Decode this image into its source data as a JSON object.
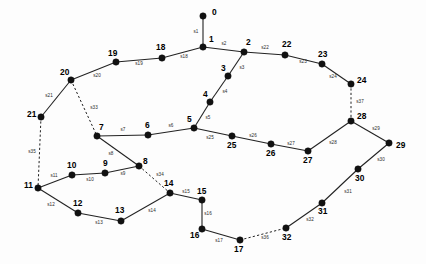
{
  "diagram": {
    "type": "node-link-graph",
    "background_color": "#fdfdfd",
    "node_color": "#111111",
    "edge_color": "#222222",
    "label_color": "#000000",
    "canvas": {
      "width": 426,
      "height": 264
    },
    "node_count": 33,
    "edge_count": 37
  },
  "nodes": [
    {
      "id": "0",
      "label": "0",
      "x": 203,
      "y": 16,
      "lx": 212,
      "ly": 13,
      "anchor": "start"
    },
    {
      "id": "1",
      "label": "1",
      "x": 203,
      "y": 47,
      "lx": 209,
      "ly": 40,
      "anchor": "start"
    },
    {
      "id": "2",
      "label": "2",
      "x": 244,
      "y": 52,
      "lx": 246,
      "ly": 43,
      "anchor": "start"
    },
    {
      "id": "3",
      "label": "3",
      "x": 228,
      "y": 76,
      "lx": 221,
      "ly": 69,
      "anchor": "start"
    },
    {
      "id": "4",
      "label": "4",
      "x": 210,
      "y": 102,
      "lx": 203,
      "ly": 95,
      "anchor": "start"
    },
    {
      "id": "5",
      "label": "5",
      "x": 194,
      "y": 128,
      "lx": 187,
      "ly": 120,
      "anchor": "start"
    },
    {
      "id": "6",
      "label": "6",
      "x": 148,
      "y": 135,
      "lx": 145,
      "ly": 126,
      "anchor": "start"
    },
    {
      "id": "7",
      "label": "7",
      "x": 97,
      "y": 136,
      "lx": 99,
      "ly": 128,
      "anchor": "start"
    },
    {
      "id": "8",
      "label": "8",
      "x": 139,
      "y": 166,
      "lx": 143,
      "ly": 162,
      "anchor": "start"
    },
    {
      "id": "9",
      "label": "9",
      "x": 105,
      "y": 173,
      "lx": 103,
      "ly": 164,
      "anchor": "start"
    },
    {
      "id": "10",
      "label": "10",
      "x": 72,
      "y": 175,
      "lx": 67,
      "ly": 166,
      "anchor": "start"
    },
    {
      "id": "11",
      "label": "11",
      "x": 38,
      "y": 188,
      "lx": 24,
      "ly": 186,
      "anchor": "start"
    },
    {
      "id": "12",
      "label": "12",
      "x": 78,
      "y": 213,
      "lx": 73,
      "ly": 204,
      "anchor": "start"
    },
    {
      "id": "13",
      "label": "13",
      "x": 121,
      "y": 221,
      "lx": 115,
      "ly": 211,
      "anchor": "start"
    },
    {
      "id": "14",
      "label": "14",
      "x": 170,
      "y": 193,
      "lx": 164,
      "ly": 184,
      "anchor": "start"
    },
    {
      "id": "15",
      "label": "15",
      "x": 202,
      "y": 200,
      "lx": 197,
      "ly": 192,
      "anchor": "start"
    },
    {
      "id": "16",
      "label": "16",
      "x": 202,
      "y": 229,
      "lx": 190,
      "ly": 236,
      "anchor": "start"
    },
    {
      "id": "17",
      "label": "17",
      "x": 240,
      "y": 240,
      "lx": 234,
      "ly": 250,
      "anchor": "start"
    },
    {
      "id": "18",
      "label": "18",
      "x": 162,
      "y": 58,
      "lx": 156,
      "ly": 48,
      "anchor": "start"
    },
    {
      "id": "19",
      "label": "19",
      "x": 116,
      "y": 62,
      "lx": 108,
      "ly": 54,
      "anchor": "start"
    },
    {
      "id": "20",
      "label": "20",
      "x": 71,
      "y": 80,
      "lx": 60,
      "ly": 73,
      "anchor": "start"
    },
    {
      "id": "21",
      "label": "21",
      "x": 41,
      "y": 117,
      "lx": 27,
      "ly": 115,
      "anchor": "start"
    },
    {
      "id": "22",
      "label": "22",
      "x": 285,
      "y": 55,
      "lx": 282,
      "ly": 45,
      "anchor": "start"
    },
    {
      "id": "23",
      "label": "23",
      "x": 322,
      "y": 64,
      "lx": 318,
      "ly": 55,
      "anchor": "start"
    },
    {
      "id": "24",
      "label": "24",
      "x": 351,
      "y": 84,
      "lx": 357,
      "ly": 81,
      "anchor": "start"
    },
    {
      "id": "25",
      "label": "25",
      "x": 232,
      "y": 136,
      "lx": 227,
      "ly": 146,
      "anchor": "start"
    },
    {
      "id": "26",
      "label": "26",
      "x": 271,
      "y": 144,
      "lx": 266,
      "ly": 154,
      "anchor": "start"
    },
    {
      "id": "27",
      "label": "27",
      "x": 308,
      "y": 151,
      "lx": 303,
      "ly": 161,
      "anchor": "start"
    },
    {
      "id": "28",
      "label": "28",
      "x": 351,
      "y": 121,
      "lx": 357,
      "ly": 117,
      "anchor": "start"
    },
    {
      "id": "29",
      "label": "29",
      "x": 389,
      "y": 143,
      "lx": 396,
      "ly": 146,
      "anchor": "start"
    },
    {
      "id": "30",
      "label": "30",
      "x": 358,
      "y": 169,
      "lx": 355,
      "ly": 179,
      "anchor": "start"
    },
    {
      "id": "31",
      "label": "31",
      "x": 322,
      "y": 203,
      "lx": 318,
      "ly": 212,
      "anchor": "start"
    },
    {
      "id": "32",
      "label": "32",
      "x": 286,
      "y": 228,
      "lx": 282,
      "ly": 238,
      "anchor": "start"
    }
  ],
  "edges": [
    {
      "id": "s1",
      "label": "s1",
      "from": "0",
      "to": "1",
      "style": "solid",
      "lx": 196,
      "ly": 32
    },
    {
      "id": "s2",
      "label": "s2",
      "from": "1",
      "to": "2",
      "style": "solid",
      "lx": 224,
      "ly": 44
    },
    {
      "id": "s3",
      "label": "s3",
      "from": "2",
      "to": "3",
      "style": "solid",
      "lx": 242,
      "ly": 68
    },
    {
      "id": "s4",
      "label": "s4",
      "from": "3",
      "to": "4",
      "style": "solid",
      "lx": 225,
      "ly": 92
    },
    {
      "id": "s5",
      "label": "s5",
      "from": "4",
      "to": "5",
      "style": "solid",
      "lx": 208,
      "ly": 118
    },
    {
      "id": "s6",
      "label": "s6",
      "from": "5",
      "to": "6",
      "style": "solid",
      "lx": 171,
      "ly": 126
    },
    {
      "id": "s7",
      "label": "s7",
      "from": "6",
      "to": "7",
      "style": "solid",
      "lx": 123,
      "ly": 130
    },
    {
      "id": "s8",
      "label": "s8",
      "from": "7",
      "to": "8",
      "style": "solid",
      "lx": 111,
      "ly": 154
    },
    {
      "id": "s9",
      "label": "s9",
      "from": "9",
      "to": "8",
      "style": "solid",
      "lx": 123,
      "ly": 174
    },
    {
      "id": "s10",
      "label": "s10",
      "from": "10",
      "to": "9",
      "style": "solid",
      "lx": 90,
      "ly": 180
    },
    {
      "id": "s11",
      "label": "s11",
      "from": "11",
      "to": "10",
      "style": "solid",
      "lx": 54,
      "ly": 176
    },
    {
      "id": "s12",
      "label": "s12",
      "from": "11",
      "to": "12",
      "style": "solid",
      "lx": 51,
      "ly": 205
    },
    {
      "id": "s13",
      "label": "s13",
      "from": "12",
      "to": "13",
      "style": "solid",
      "lx": 99,
      "ly": 223
    },
    {
      "id": "s14",
      "label": "s14",
      "from": "13",
      "to": "14",
      "style": "solid",
      "lx": 152,
      "ly": 211
    },
    {
      "id": "s15",
      "label": "s15",
      "from": "14",
      "to": "15",
      "style": "solid",
      "lx": 186,
      "ly": 192
    },
    {
      "id": "s16",
      "label": "s16",
      "from": "15",
      "to": "16",
      "style": "solid",
      "lx": 208,
      "ly": 214
    },
    {
      "id": "s17",
      "label": "s17",
      "from": "16",
      "to": "17",
      "style": "solid",
      "lx": 219,
      "ly": 241
    },
    {
      "id": "s18",
      "label": "s18",
      "from": "1",
      "to": "18",
      "style": "solid",
      "lx": 184,
      "ly": 57
    },
    {
      "id": "s19",
      "label": "s19",
      "from": "18",
      "to": "19",
      "style": "solid",
      "lx": 139,
      "ly": 64
    },
    {
      "id": "s20",
      "label": "s20",
      "from": "19",
      "to": "20",
      "style": "solid",
      "lx": 97,
      "ly": 76
    },
    {
      "id": "s21",
      "label": "s21",
      "from": "20",
      "to": "21",
      "style": "solid",
      "lx": 49,
      "ly": 96
    },
    {
      "id": "s22",
      "label": "s22",
      "from": "2",
      "to": "22",
      "style": "solid",
      "lx": 265,
      "ly": 48
    },
    {
      "id": "s23",
      "label": "s23",
      "from": "22",
      "to": "23",
      "style": "solid",
      "lx": 303,
      "ly": 62
    },
    {
      "id": "s24",
      "label": "s24",
      "from": "23",
      "to": "24",
      "style": "solid",
      "lx": 333,
      "ly": 77
    },
    {
      "id": "s25",
      "label": "s25",
      "from": "5",
      "to": "25",
      "style": "solid",
      "lx": 210,
      "ly": 138
    },
    {
      "id": "s26",
      "label": "s26",
      "from": "25",
      "to": "26",
      "style": "solid",
      "lx": 253,
      "ly": 136
    },
    {
      "id": "s27",
      "label": "s27",
      "from": "26",
      "to": "27",
      "style": "solid",
      "lx": 291,
      "ly": 144
    },
    {
      "id": "s28",
      "label": "s28",
      "from": "27",
      "to": "28",
      "style": "solid",
      "lx": 333,
      "ly": 143
    },
    {
      "id": "s29",
      "label": "s29",
      "from": "28",
      "to": "29",
      "style": "solid",
      "lx": 376,
      "ly": 129
    },
    {
      "id": "s30",
      "label": "s30",
      "from": "29",
      "to": "30",
      "style": "solid",
      "lx": 381,
      "ly": 160
    },
    {
      "id": "s31",
      "label": "s31",
      "from": "30",
      "to": "31",
      "style": "solid",
      "lx": 348,
      "ly": 192
    },
    {
      "id": "s32",
      "label": "s32",
      "from": "31",
      "to": "32",
      "style": "solid",
      "lx": 310,
      "ly": 220
    },
    {
      "id": "s33",
      "label": "s33",
      "from": "20",
      "to": "7",
      "style": "dashed",
      "lx": 94,
      "ly": 108
    },
    {
      "id": "s34",
      "label": "s34",
      "from": "8",
      "to": "14",
      "style": "dashed",
      "lx": 160,
      "ly": 175
    },
    {
      "id": "s35",
      "label": "s35",
      "from": "21",
      "to": "11",
      "style": "dashed",
      "lx": 32,
      "ly": 152
    },
    {
      "id": "s36",
      "label": "s36",
      "from": "17",
      "to": "32",
      "style": "dashed",
      "lx": 265,
      "ly": 238
    },
    {
      "id": "s37",
      "label": "s37",
      "from": "24",
      "to": "28",
      "style": "dashed",
      "lx": 360,
      "ly": 102
    }
  ]
}
